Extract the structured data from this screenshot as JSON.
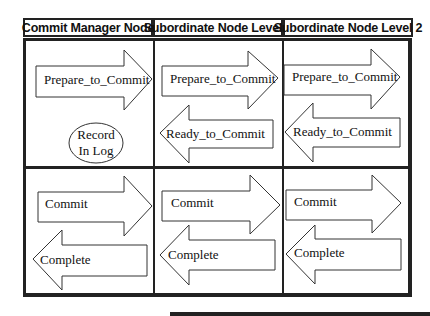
{
  "headers": [
    "Commit Manager Node",
    "Subordinate Node Level 1",
    "Subordinate Node Level 2"
  ],
  "phase1": {
    "manager_arrow": "Prepare_to_Commit",
    "manager_log_line1": "Record",
    "manager_log_line2": "In Log",
    "level1_right_arrow": "Prepare_to_Commit",
    "level1_left_arrow": "Ready_to_Commit",
    "level2_right_arrow": "Prepare_to_Commit",
    "level2_left_arrow": "Ready_to_Commit"
  },
  "phase2": {
    "manager_right_arrow": "Commit",
    "manager_left_arrow": "Complete",
    "level1_right_arrow": "Commit",
    "level1_left_arrow": "Complete",
    "level2_right_arrow": "Commit",
    "level2_left_arrow": "Complete"
  }
}
